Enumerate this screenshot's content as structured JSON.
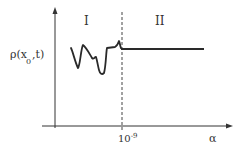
{
  "diagram": {
    "regions": [
      {
        "id": "I",
        "label": "I"
      },
      {
        "id": "II",
        "label": "II"
      }
    ],
    "y_axis": {
      "label_main": "ρ(x",
      "label_sub": "0",
      "label_tail": ",t)"
    },
    "x_axis": {
      "label": "α",
      "tick_base": "10",
      "tick_exp": "-9"
    },
    "colors": {
      "ink": "#333333",
      "background": "#ffffff"
    }
  }
}
